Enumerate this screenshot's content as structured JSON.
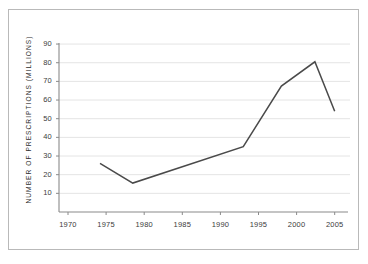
{
  "chart_data": {
    "type": "line",
    "title": "",
    "xlabel": "",
    "ylabel": "NUMBER OF PRESCRIPTIONS (MILLIONS)",
    "xlim": [
      1970,
      2006
    ],
    "ylim": [
      0,
      90
    ],
    "grid": "horizontal",
    "legend": "none",
    "x_ticks": [
      1970,
      1975,
      1980,
      1985,
      1990,
      1995,
      2000,
      2005
    ],
    "x_tick_labels": [
      "1970",
      "1975",
      "1980",
      "1985",
      "1990",
      "1995",
      "2000",
      "2005"
    ],
    "y_ticks": [
      10,
      20,
      30,
      40,
      50,
      60,
      70,
      80,
      90
    ],
    "y_tick_labels": [
      "10",
      "20",
      "30",
      "40",
      "50",
      "60",
      "70",
      "80",
      "90"
    ],
    "series": [
      {
        "name": "Prescriptions",
        "color": "#4a4a4a",
        "x": [
          1974.2,
          1978.5,
          1993.0,
          1998.0,
          2002.4,
          2005.0
        ],
        "values": [
          26,
          15.5,
          35,
          67.5,
          80.5,
          54
        ]
      }
    ]
  },
  "colors": {
    "line": "#4a4a4a",
    "gridline": "#e4e4e4",
    "axis": "#8a8a8a",
    "border": "#b9b9b9",
    "background": "#ffffff",
    "text": "#3b3b3b"
  }
}
